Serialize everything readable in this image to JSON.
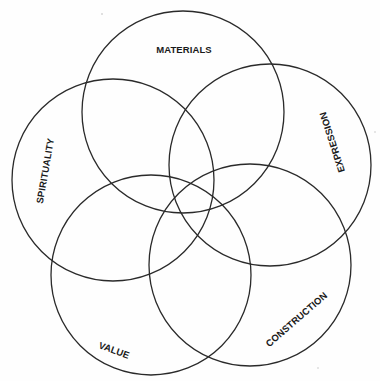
{
  "diagram": {
    "type": "five-circle-venn",
    "stroke_color": "#2a2a2a",
    "background": "#fefefe",
    "circles": [
      {
        "id": "materials",
        "label": "MATERIALS",
        "cx": 183,
        "cy": 112,
        "r": 101,
        "label_x": 184,
        "label_y": 50,
        "label_rotate": 0
      },
      {
        "id": "spirituality",
        "label": "SPIRITUALITY",
        "cx": 113,
        "cy": 180,
        "r": 101,
        "label_x": 46,
        "label_y": 171,
        "label_rotate": -80
      },
      {
        "id": "expression",
        "label": "EXPRESSION",
        "cx": 270,
        "cy": 165,
        "r": 101,
        "label_x": 333,
        "label_y": 142,
        "label_rotate": -108
      },
      {
        "id": "value",
        "label": "VALUE",
        "cx": 151,
        "cy": 275,
        "r": 100,
        "label_x": 114,
        "label_y": 351,
        "label_rotate": 20
      },
      {
        "id": "construction",
        "label": "CONSTRUCTION",
        "cx": 250,
        "cy": 265,
        "r": 101,
        "label_x": 297,
        "label_y": 320,
        "label_rotate": -41
      }
    ]
  }
}
